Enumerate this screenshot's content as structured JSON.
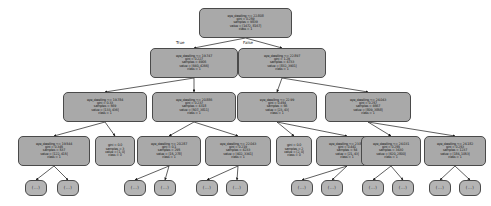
{
  "diagram": {
    "type": "decision-tree",
    "feature": "eye_dwelling",
    "background": "#ffffff",
    "node_fill": "#a8a8a8",
    "node_stroke": "#4a4a4a",
    "edge_labels": {
      "left": "True",
      "right": "False"
    }
  },
  "nodes": [
    {
      "id": "n0",
      "kind": "split",
      "x": 199,
      "y": 8,
      "w": 93,
      "h": 30,
      "lines": [
        "eye_dwelling <= 22.808",
        "gini = 0.259",
        "samples = 9839",
        "value = [1472, 8167]",
        "class = 1"
      ]
    },
    {
      "id": "n1",
      "kind": "split",
      "x": 150,
      "y": 48,
      "w": 88,
      "h": 30,
      "lines": [
        "eye_dwelling <= 19.747",
        "gini = 0.227",
        "samples = 4906",
        "value = [640, 4266]",
        "class = 1"
      ]
    },
    {
      "id": "n2",
      "kind": "split",
      "x": 238,
      "y": 48,
      "w": 88,
      "h": 30,
      "lines": [
        "eye_dwelling <= 22.897",
        "gini = 1.29",
        "samples = 4733",
        "value = [832, 3901]",
        "class = 1"
      ]
    },
    {
      "id": "n3",
      "kind": "split",
      "x": 63,
      "y": 92,
      "w": 84,
      "h": 30,
      "lines": [
        "eye_dwelling <= 19.784",
        "gini = 0.33",
        "samples = 569",
        "value = [133, 436]",
        "class = 1"
      ]
    },
    {
      "id": "n4",
      "kind": "split",
      "x": 152,
      "y": 92,
      "w": 84,
      "h": 30,
      "lines": [
        "eye_dwelling <= 20.886",
        "gini = 0.237",
        "samples = 4318",
        "value = [507, 3811]",
        "class = 1"
      ]
    },
    {
      "id": "n5",
      "kind": "split",
      "x": 237,
      "y": 92,
      "w": 80,
      "h": 30,
      "lines": [
        "eye_dwelling <= 22.99",
        "gini = 0.454",
        "samples = 66",
        "value = [23, 43]",
        "class = 1"
      ]
    },
    {
      "id": "n6",
      "kind": "split",
      "x": 325,
      "y": 92,
      "w": 86,
      "h": 30,
      "lines": [
        "eye_dwelling <= 24.043",
        "gini = 0.257",
        "samples = 4667",
        "value = [809, 3858]",
        "class = 1"
      ]
    },
    {
      "id": "n7",
      "kind": "split",
      "x": 18,
      "y": 136,
      "w": 72,
      "h": 30,
      "lines": [
        "eye_dwelling <= 19.544",
        "gini = 0.345",
        "samples = 537",
        "value = [122, 415]",
        "class = 1"
      ]
    },
    {
      "id": "n8",
      "kind": "terminal",
      "x": 95,
      "y": 136,
      "w": 40,
      "h": 30,
      "lines": [
        "gini = 0.0",
        "samples = 3",
        "value = [1, 0]",
        "class = 0"
      ]
    },
    {
      "id": "n9",
      "kind": "split",
      "x": 137,
      "y": 136,
      "w": 64,
      "h": 30,
      "lines": [
        "eye_dwelling <= 20.287",
        "gini = 0.1",
        "samples = 295",
        "value = [15, 278]",
        "class = 1"
      ]
    },
    {
      "id": "n10",
      "kind": "split",
      "x": 205,
      "y": 136,
      "w": 66,
      "h": 30,
      "lines": [
        "eye_dwelling <= 22.043",
        "gini = 0.219",
        "samples = 4233",
        "value = [402, 3341]",
        "class = 1"
      ]
    },
    {
      "id": "n11",
      "kind": "terminal",
      "x": 276,
      "y": 136,
      "w": 36,
      "h": 30,
      "lines": [
        "gini = 0.0",
        "samples = 2",
        "value = [2, 0]",
        "class = 0"
      ]
    },
    {
      "id": "n12",
      "kind": "split",
      "x": 316,
      "y": 136,
      "w": 62,
      "h": 30,
      "lines": [
        "eye_dwelling <= 23.898",
        "gini = 0.441",
        "samples = 54",
        "value = [21, 43]",
        "class = 1"
      ]
    },
    {
      "id": "n13",
      "kind": "split",
      "x": 361,
      "y": 136,
      "w": 60,
      "h": 30,
      "lines": [
        "eye_dwelling <= 24.031",
        "gini = 0.255",
        "samples = 3430",
        "value = [620, 2800]",
        "class = 1"
      ]
    },
    {
      "id": "n14",
      "kind": "split",
      "x": 424,
      "y": 136,
      "w": 62,
      "h": 30,
      "lines": [
        "eye_dwelling <= 24.182",
        "gini = 0.253",
        "samples = 1237",
        "value = [184, 1053]",
        "class = 1"
      ]
    },
    {
      "id": "l1",
      "kind": "leaf",
      "x": 25,
      "y": 180,
      "w": 22,
      "h": 16,
      "lines": [
        "(...)"
      ]
    },
    {
      "id": "l2",
      "kind": "leaf",
      "x": 57,
      "y": 180,
      "w": 22,
      "h": 16,
      "lines": [
        "(...)"
      ]
    },
    {
      "id": "l3",
      "kind": "leaf",
      "x": 124,
      "y": 180,
      "w": 22,
      "h": 16,
      "lines": [
        "(...)"
      ]
    },
    {
      "id": "l4",
      "kind": "leaf",
      "x": 154,
      "y": 180,
      "w": 22,
      "h": 16,
      "lines": [
        "(...)"
      ]
    },
    {
      "id": "l5",
      "kind": "leaf",
      "x": 196,
      "y": 180,
      "w": 22,
      "h": 16,
      "lines": [
        "(...)"
      ]
    },
    {
      "id": "l6",
      "kind": "leaf",
      "x": 226,
      "y": 180,
      "w": 22,
      "h": 16,
      "lines": [
        "(...)"
      ]
    },
    {
      "id": "l7",
      "kind": "leaf",
      "x": 291,
      "y": 180,
      "w": 22,
      "h": 16,
      "lines": [
        "(...)"
      ]
    },
    {
      "id": "l8",
      "kind": "leaf",
      "x": 321,
      "y": 180,
      "w": 22,
      "h": 16,
      "lines": [
        "(...)"
      ]
    },
    {
      "id": "l9",
      "kind": "leaf",
      "x": 362,
      "y": 180,
      "w": 22,
      "h": 16,
      "lines": [
        "(...)"
      ]
    },
    {
      "id": "l10",
      "kind": "leaf",
      "x": 392,
      "y": 180,
      "w": 22,
      "h": 16,
      "lines": [
        "(...)"
      ]
    },
    {
      "id": "l11",
      "kind": "leaf",
      "x": 429,
      "y": 180,
      "w": 22,
      "h": 16,
      "lines": [
        "(...)"
      ]
    },
    {
      "id": "l12",
      "kind": "leaf",
      "x": 459,
      "y": 180,
      "w": 22,
      "h": 16,
      "lines": [
        "(...)"
      ]
    }
  ],
  "edges": [
    {
      "from": "n0",
      "to": "n1",
      "label": "True"
    },
    {
      "from": "n0",
      "to": "n2",
      "label": "False"
    },
    {
      "from": "n1",
      "to": "n3",
      "label": ""
    },
    {
      "from": "n1",
      "to": "n4",
      "label": ""
    },
    {
      "from": "n2",
      "to": "n5",
      "label": ""
    },
    {
      "from": "n2",
      "to": "n6",
      "label": ""
    },
    {
      "from": "n3",
      "to": "n7",
      "label": ""
    },
    {
      "from": "n3",
      "to": "n8",
      "label": ""
    },
    {
      "from": "n4",
      "to": "n9",
      "label": ""
    },
    {
      "from": "n4",
      "to": "n10",
      "label": ""
    },
    {
      "from": "n5",
      "to": "n11",
      "label": ""
    },
    {
      "from": "n5",
      "to": "n12",
      "label": ""
    },
    {
      "from": "n6",
      "to": "n13",
      "label": ""
    },
    {
      "from": "n6",
      "to": "n14",
      "label": ""
    },
    {
      "from": "n7",
      "to": "l1",
      "label": ""
    },
    {
      "from": "n7",
      "to": "l2",
      "label": ""
    },
    {
      "from": "n9",
      "to": "l3",
      "label": ""
    },
    {
      "from": "n9",
      "to": "l4",
      "label": ""
    },
    {
      "from": "n10",
      "to": "l5",
      "label": ""
    },
    {
      "from": "n10",
      "to": "l6",
      "label": ""
    },
    {
      "from": "n12",
      "to": "l7",
      "label": ""
    },
    {
      "from": "n12",
      "to": "l8",
      "label": ""
    },
    {
      "from": "n13",
      "to": "l9",
      "label": ""
    },
    {
      "from": "n13",
      "to": "l10",
      "label": ""
    },
    {
      "from": "n14",
      "to": "l11",
      "label": ""
    },
    {
      "from": "n14",
      "to": "l12",
      "label": ""
    }
  ],
  "edge_label_positions": [
    {
      "text": "True",
      "x": 176,
      "y": 40
    },
    {
      "text": "False",
      "x": 243,
      "y": 40
    }
  ]
}
